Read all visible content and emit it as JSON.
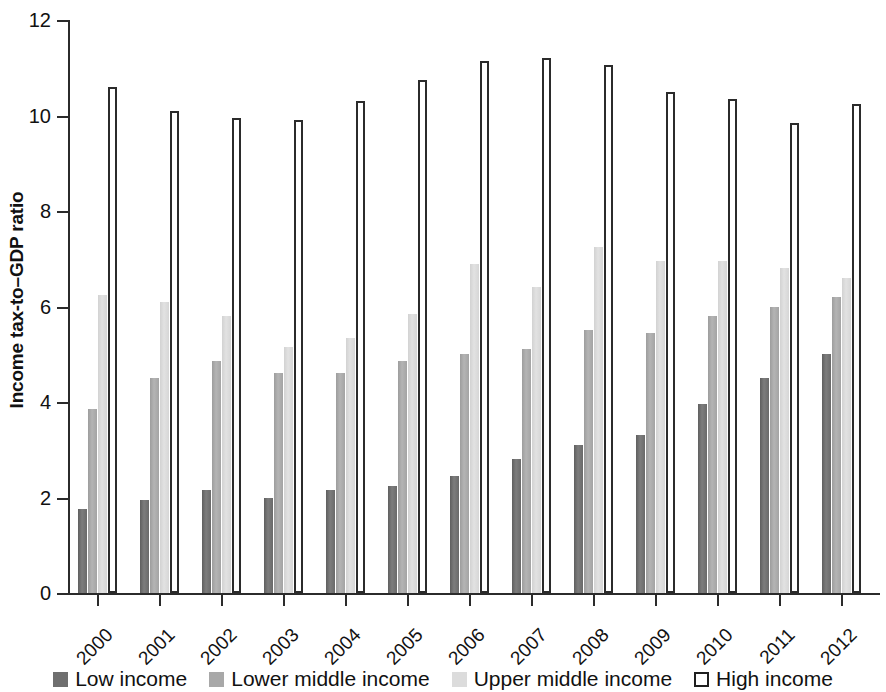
{
  "chart_data": {
    "type": "bar",
    "title": "",
    "xlabel": "",
    "ylabel": "Income tax-to–GDP ratio",
    "ylim": [
      0,
      12
    ],
    "yticks": [
      0,
      2,
      4,
      6,
      8,
      10,
      12
    ],
    "ytick_labels": [
      "0",
      "2",
      "4",
      "6",
      "8",
      "10",
      "12"
    ],
    "grid": false,
    "legend_position": "bottom",
    "categories": [
      "2000",
      "2001",
      "2002",
      "2003",
      "2004",
      "2005",
      "2006",
      "2007",
      "2008",
      "2009",
      "2010",
      "2011",
      "2012"
    ],
    "series": [
      {
        "name": "Low income",
        "color": "#6f6f6f",
        "values": [
          1.75,
          1.95,
          2.15,
          2.0,
          2.15,
          2.25,
          2.45,
          2.8,
          3.1,
          3.3,
          3.95,
          4.5,
          5.0
        ]
      },
      {
        "name": "Lower middle income",
        "color": "#a8a8a8",
        "values": [
          3.85,
          4.5,
          4.85,
          4.6,
          4.6,
          4.85,
          5.0,
          5.1,
          5.5,
          5.45,
          5.8,
          6.0,
          6.2
        ]
      },
      {
        "name": "Upper middle income",
        "color": "#dcdcdc",
        "values": [
          6.25,
          6.1,
          5.8,
          5.15,
          5.35,
          5.85,
          6.9,
          6.4,
          7.25,
          6.95,
          6.95,
          6.8,
          6.6
        ]
      },
      {
        "name": "High income",
        "color": "#ffffff",
        "values": [
          10.6,
          10.1,
          9.95,
          9.9,
          10.3,
          10.75,
          11.15,
          11.2,
          11.05,
          10.5,
          10.35,
          9.85,
          10.25
        ]
      }
    ]
  },
  "legend": {
    "items": [
      {
        "label": "Low income",
        "swatch": "sw-low"
      },
      {
        "label": "Lower middle income",
        "swatch": "sw-lower-middle"
      },
      {
        "label": "Upper middle income",
        "swatch": "sw-upper-middle"
      },
      {
        "label": "High income",
        "swatch": "sw-high"
      }
    ]
  }
}
